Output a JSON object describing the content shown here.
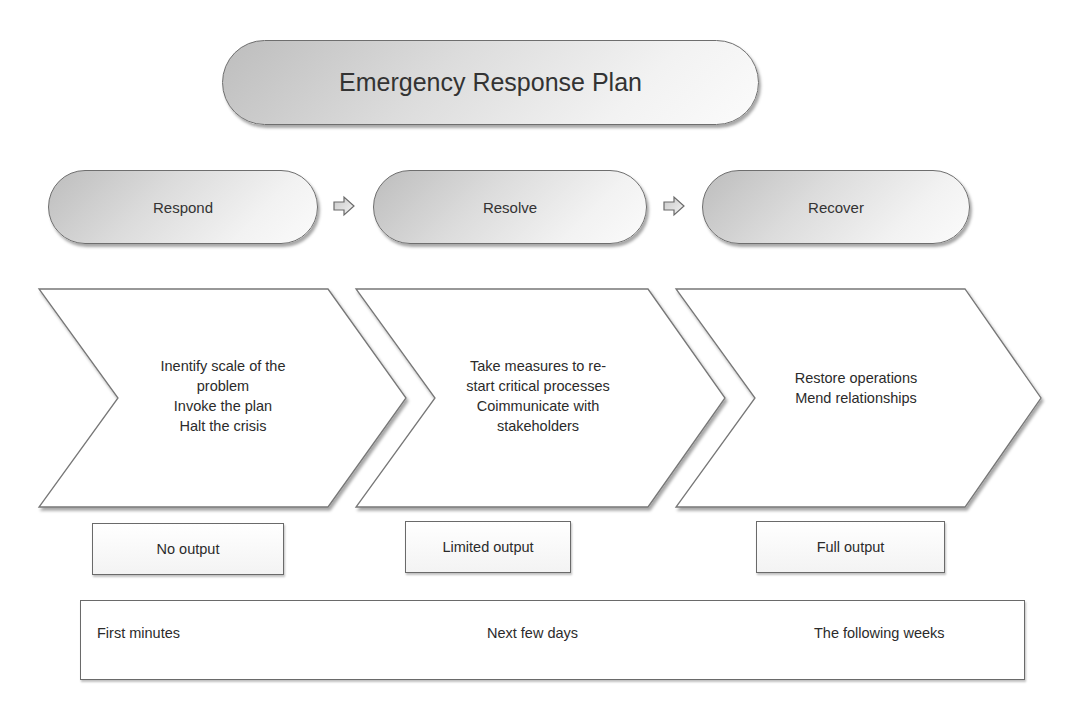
{
  "title": "Emergency Response Plan",
  "phases": [
    {
      "label": "Respond"
    },
    {
      "label": "Resolve"
    },
    {
      "label": "Recover"
    }
  ],
  "arrows": [
    {
      "icon": "right-arrow-icon"
    },
    {
      "icon": "right-arrow-icon"
    }
  ],
  "chevrons": [
    {
      "lines": [
        "Inentify scale of the",
        "problem",
        "Invoke the plan",
        "Halt the crisis"
      ]
    },
    {
      "lines": [
        "Take measures to re-",
        "start critical processes",
        "Coimmunicate with",
        "stakeholders"
      ]
    },
    {
      "lines": [
        "Restore operations",
        "Mend relationships"
      ]
    }
  ],
  "outputs": [
    {
      "label": "No output"
    },
    {
      "label": "Limited output"
    },
    {
      "label": "Full output"
    }
  ],
  "timeline": [
    {
      "label": "First minutes"
    },
    {
      "label": "Next few days"
    },
    {
      "label": "The following weeks"
    }
  ],
  "colors": {
    "border": "#6e6e6e",
    "pill_gradient_dark": "#bdbdbd",
    "pill_gradient_light": "#fbfbfb",
    "text": "#2b2b2b"
  }
}
